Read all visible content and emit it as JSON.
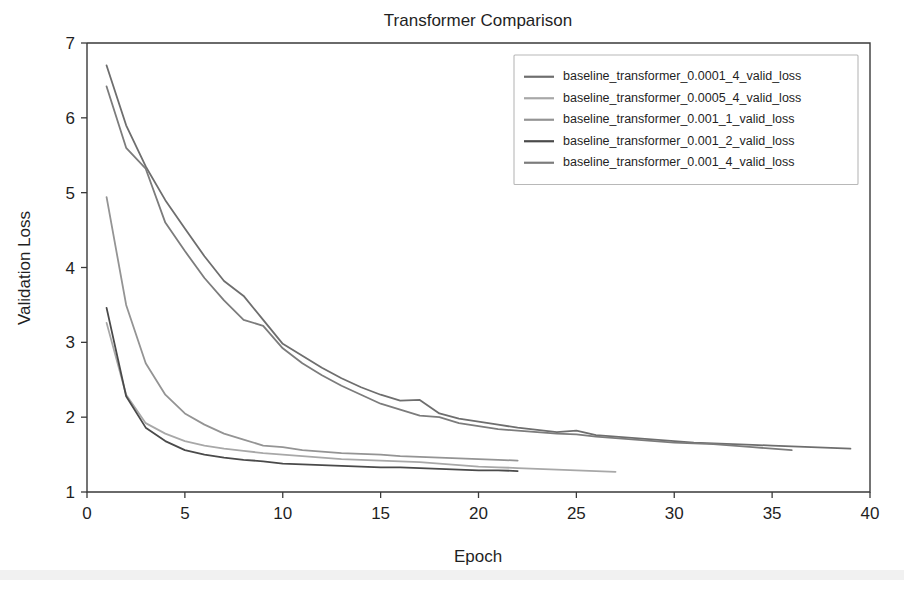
{
  "figure": {
    "title": "Transformer Comparison",
    "background": "#ffffff",
    "width": 904,
    "height": 592
  },
  "axes": {
    "xlabel": "Epoch",
    "ylabel": "Validation Loss",
    "x_ticks": [
      "0",
      "5",
      "10",
      "15",
      "20",
      "25",
      "30",
      "35",
      "40"
    ],
    "y_ticks": [
      "1",
      "2",
      "3",
      "4",
      "5",
      "6",
      "7"
    ]
  },
  "legend": {
    "location": "upper right",
    "items": [
      {
        "label": "baseline_transformer_0.0001_4_valid_loss",
        "color": "#6e6e6e"
      },
      {
        "label": "baseline_transformer_0.0005_4_valid_loss",
        "color": "#a8a8a8"
      },
      {
        "label": "baseline_transformer_0.001_1_valid_loss",
        "color": "#949494"
      },
      {
        "label": "baseline_transformer_0.001_2_valid_loss",
        "color": "#4a4a4a"
      },
      {
        "label": "baseline_transformer_0.001_4_valid_loss",
        "color": "#7c7c7c"
      }
    ]
  },
  "chart_data": {
    "type": "line",
    "title": "Transformer Comparison",
    "xlabel": "Epoch",
    "ylabel": "Validation Loss",
    "xlim": [
      0,
      40
    ],
    "ylim": [
      1,
      7
    ],
    "x_ticks": [
      0,
      5,
      10,
      15,
      20,
      25,
      30,
      35,
      40
    ],
    "y_ticks": [
      1,
      2,
      3,
      4,
      5,
      6,
      7
    ],
    "grid": false,
    "legend_position": "upper right",
    "series": [
      {
        "name": "baseline_transformer_0.0001_4_valid_loss",
        "color": "#6e6e6e",
        "x": [
          1,
          2,
          3,
          4,
          5,
          6,
          7,
          8,
          9,
          10,
          11,
          12,
          13,
          14,
          15,
          16,
          17,
          18,
          19,
          20,
          21,
          22,
          23,
          24,
          25,
          26,
          27,
          28,
          29,
          30,
          31,
          32,
          33,
          34,
          35,
          36,
          37,
          38,
          39
        ],
        "y": [
          6.7,
          5.9,
          5.35,
          4.9,
          4.52,
          4.15,
          3.82,
          3.62,
          3.3,
          2.98,
          2.82,
          2.66,
          2.52,
          2.4,
          2.3,
          2.22,
          2.23,
          2.05,
          1.98,
          1.94,
          1.9,
          1.86,
          1.83,
          1.8,
          1.82,
          1.76,
          1.74,
          1.72,
          1.7,
          1.68,
          1.66,
          1.65,
          1.64,
          1.63,
          1.62,
          1.61,
          1.6,
          1.59,
          1.58
        ]
      },
      {
        "name": "baseline_transformer_0.0005_4_valid_loss",
        "color": "#a8a8a8",
        "x": [
          1,
          2,
          3,
          4,
          5,
          6,
          7,
          8,
          9,
          10,
          11,
          12,
          13,
          14,
          15,
          16,
          17,
          18,
          19,
          20,
          21,
          22,
          23,
          24,
          25,
          26,
          27
        ],
        "y": [
          3.26,
          2.3,
          1.92,
          1.78,
          1.68,
          1.62,
          1.58,
          1.55,
          1.52,
          1.5,
          1.48,
          1.46,
          1.44,
          1.43,
          1.42,
          1.41,
          1.4,
          1.38,
          1.36,
          1.34,
          1.33,
          1.32,
          1.31,
          1.3,
          1.29,
          1.28,
          1.27
        ]
      },
      {
        "name": "baseline_transformer_0.001_1_valid_loss",
        "color": "#949494",
        "x": [
          1,
          2,
          3,
          4,
          5,
          6,
          7,
          8,
          9,
          10,
          11,
          12,
          13,
          14,
          15,
          16,
          17,
          18,
          19,
          20,
          21,
          22
        ],
        "y": [
          4.94,
          3.5,
          2.72,
          2.3,
          2.05,
          1.9,
          1.78,
          1.7,
          1.62,
          1.6,
          1.56,
          1.54,
          1.52,
          1.51,
          1.5,
          1.48,
          1.47,
          1.46,
          1.45,
          1.44,
          1.43,
          1.42
        ]
      },
      {
        "name": "baseline_transformer_0.001_2_valid_loss",
        "color": "#4a4a4a",
        "x": [
          1,
          2,
          3,
          4,
          5,
          6,
          7,
          8,
          9,
          10,
          11,
          12,
          13,
          14,
          15,
          16,
          17,
          18,
          19,
          20,
          21,
          22
        ],
        "y": [
          3.46,
          2.28,
          1.86,
          1.68,
          1.56,
          1.5,
          1.46,
          1.43,
          1.41,
          1.38,
          1.37,
          1.36,
          1.35,
          1.34,
          1.33,
          1.33,
          1.32,
          1.31,
          1.3,
          1.29,
          1.29,
          1.28
        ]
      },
      {
        "name": "baseline_transformer_0.001_4_valid_loss",
        "color": "#7c7c7c",
        "x": [
          1,
          2,
          3,
          4,
          5,
          6,
          7,
          8,
          9,
          10,
          11,
          12,
          13,
          14,
          15,
          16,
          17,
          18,
          19,
          20,
          21,
          22,
          23,
          24,
          25,
          26,
          27,
          28,
          29,
          30,
          31,
          32,
          33,
          34,
          35,
          36
        ],
        "y": [
          6.42,
          5.6,
          5.32,
          4.6,
          4.22,
          3.86,
          3.56,
          3.3,
          3.22,
          2.92,
          2.72,
          2.56,
          2.42,
          2.3,
          2.18,
          2.1,
          2.02,
          2.0,
          1.92,
          1.88,
          1.84,
          1.82,
          1.8,
          1.78,
          1.77,
          1.74,
          1.72,
          1.7,
          1.68,
          1.66,
          1.65,
          1.64,
          1.62,
          1.6,
          1.58,
          1.56
        ]
      }
    ]
  }
}
